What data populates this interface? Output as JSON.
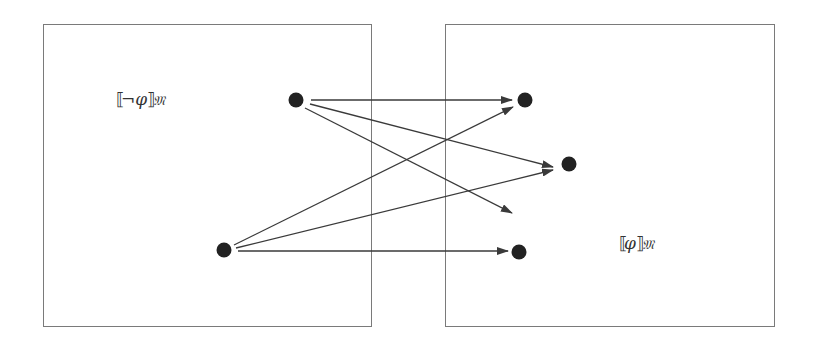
{
  "diagram": {
    "left_box": {
      "label_open": "⟦",
      "label_body": "¬φ",
      "label_close": "⟧",
      "label_sub": "𝔐",
      "x": 43,
      "y": 24,
      "w": 329,
      "h": 303
    },
    "right_box": {
      "label_open": "⟦",
      "label_body": "φ",
      "label_close": "⟧",
      "label_sub": "𝔐",
      "x": 445,
      "y": 24,
      "w": 330,
      "h": 303
    },
    "colors": {
      "border": "#7a7a7a",
      "edge": "#3a3a3a",
      "node": "#222222",
      "background": "#ffffff"
    },
    "nodes": [
      {
        "id": "a",
        "x": 296,
        "y": 100,
        "region": "left"
      },
      {
        "id": "b",
        "x": 224,
        "y": 250,
        "region": "left"
      },
      {
        "id": "c",
        "x": 525,
        "y": 100,
        "region": "right"
      },
      {
        "id": "d",
        "x": 569,
        "y": 164,
        "region": "right"
      },
      {
        "id": "e",
        "x": 519,
        "y": 252,
        "region": "right"
      }
    ],
    "edges": [
      {
        "from": "a",
        "x1": 311,
        "y1": 100,
        "x2": 512,
        "y2": 100
      },
      {
        "from": "a",
        "x1": 310,
        "y1": 104,
        "x2": 553,
        "y2": 167
      },
      {
        "from": "a",
        "x1": 305,
        "y1": 108,
        "x2": 512,
        "y2": 213
      },
      {
        "from": "b",
        "x1": 234,
        "y1": 245,
        "x2": 513,
        "y2": 107
      },
      {
        "from": "b",
        "x1": 236,
        "y1": 248,
        "x2": 553,
        "y2": 170
      },
      {
        "from": "b",
        "x1": 238,
        "y1": 251,
        "x2": 508,
        "y2": 251
      }
    ]
  }
}
